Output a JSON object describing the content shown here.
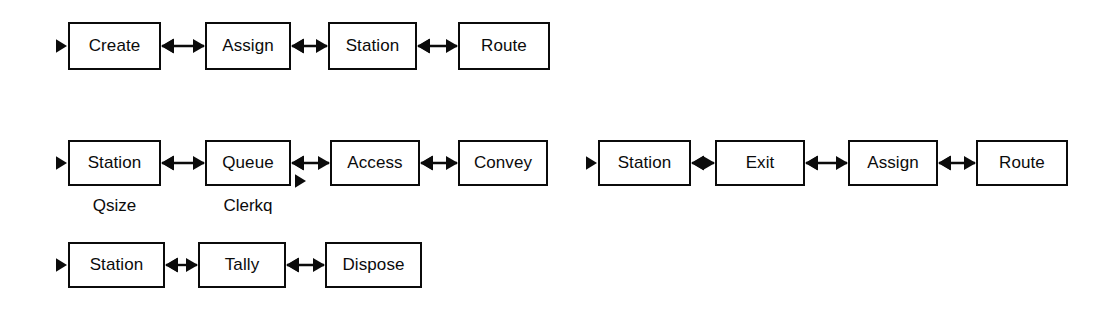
{
  "diagram": {
    "stroke_color": "#0b0b0b",
    "background_color": "#ffffff",
    "rows": [
      {
        "id": "row-1",
        "entry_marker": "solid-triangle-right",
        "nodes": [
          {
            "label": "Create",
            "x": 68,
            "y": 22,
            "w": 93,
            "h": 48
          },
          {
            "label": "Assign",
            "x": 205,
            "y": 22,
            "w": 86,
            "h": 48
          },
          {
            "label": "Station",
            "x": 328,
            "y": 22,
            "w": 89,
            "h": 48
          },
          {
            "label": "Route",
            "x": 458,
            "y": 22,
            "w": 92,
            "h": 48
          }
        ],
        "connectors": [
          {
            "from": 0,
            "to": 1,
            "type": "double-arrow"
          },
          {
            "from": 1,
            "to": 2,
            "type": "double-arrow"
          },
          {
            "from": 2,
            "to": 3,
            "type": "double-arrow"
          }
        ]
      },
      {
        "id": "row-2-left",
        "entry_marker": "solid-triangle-right",
        "nodes": [
          {
            "label": "Station",
            "x": 68,
            "y": 140,
            "w": 93,
            "h": 46,
            "sublabel": "Qsize"
          },
          {
            "label": "Queue",
            "x": 205,
            "y": 140,
            "w": 86,
            "h": 46,
            "sublabel": "Clerkq",
            "exit_marker": "solid-triangle-right"
          },
          {
            "label": "Access",
            "x": 330,
            "y": 140,
            "w": 90,
            "h": 46
          },
          {
            "label": "Convey",
            "x": 458,
            "y": 140,
            "w": 90,
            "h": 46
          }
        ],
        "connectors": [
          {
            "from": 0,
            "to": 1,
            "type": "double-arrow"
          },
          {
            "from": 1,
            "to": 2,
            "type": "double-arrow"
          },
          {
            "from": 2,
            "to": 3,
            "type": "double-arrow"
          }
        ]
      },
      {
        "id": "row-2-right",
        "entry_marker": "solid-triangle-right",
        "nodes": [
          {
            "label": "Station",
            "x": 598,
            "y": 140,
            "w": 93,
            "h": 46
          },
          {
            "label": "Exit",
            "x": 715,
            "y": 140,
            "w": 90,
            "h": 46
          },
          {
            "label": "Assign",
            "x": 848,
            "y": 140,
            "w": 90,
            "h": 46
          },
          {
            "label": "Route",
            "x": 976,
            "y": 140,
            "w": 92,
            "h": 46
          }
        ],
        "connectors": [
          {
            "from": 0,
            "to": 1,
            "type": "double-arrow"
          },
          {
            "from": 1,
            "to": 2,
            "type": "double-arrow"
          },
          {
            "from": 2,
            "to": 3,
            "type": "double-arrow"
          }
        ]
      },
      {
        "id": "row-3",
        "entry_marker": "solid-triangle-right",
        "nodes": [
          {
            "label": "Station",
            "x": 68,
            "y": 242,
            "w": 97,
            "h": 46
          },
          {
            "label": "Tally",
            "x": 198,
            "y": 242,
            "w": 88,
            "h": 46
          },
          {
            "label": "Dispose",
            "x": 325,
            "y": 242,
            "w": 97,
            "h": 46
          }
        ],
        "connectors": [
          {
            "from": 0,
            "to": 1,
            "type": "double-arrow"
          },
          {
            "from": 1,
            "to": 2,
            "type": "double-arrow"
          }
        ]
      }
    ]
  }
}
